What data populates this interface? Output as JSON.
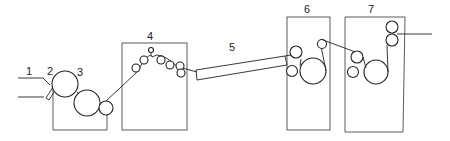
{
  "diagram": {
    "type": "process-line schematic",
    "stroke_color": "#222222",
    "background": "#ffffff",
    "labels": [
      {
        "id": "1",
        "text": "1",
        "x": 26,
        "y": 66
      },
      {
        "id": "2",
        "text": "2",
        "x": 47,
        "y": 66
      },
      {
        "id": "3",
        "text": "3",
        "x": 77,
        "y": 67
      },
      {
        "id": "4",
        "text": "4",
        "x": 147,
        "y": 31
      },
      {
        "id": "5",
        "text": "5",
        "x": 229,
        "y": 42
      },
      {
        "id": "6",
        "text": "6",
        "x": 304,
        "y": 4
      },
      {
        "id": "7",
        "text": "7",
        "x": 368,
        "y": 4
      }
    ],
    "stations": [
      {
        "number": "1",
        "name": "web-inlet"
      },
      {
        "number": "2",
        "name": "applicator-blade"
      },
      {
        "number": "3",
        "name": "roll-press-unit"
      },
      {
        "number": "4",
        "name": "roll-train-unit"
      },
      {
        "number": "5",
        "name": "drying-channel"
      },
      {
        "number": "6",
        "name": "roll-unit-6"
      },
      {
        "number": "7",
        "name": "roll-unit-7"
      }
    ]
  }
}
